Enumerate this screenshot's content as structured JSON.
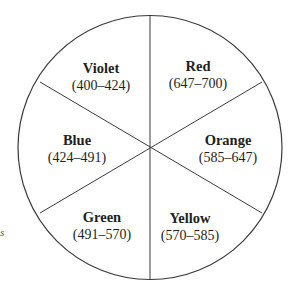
{
  "diagram": {
    "type": "color-wheel",
    "segments": [
      {
        "name": "Violet",
        "range": "(400–424)"
      },
      {
        "name": "Red",
        "range": "(647–700)"
      },
      {
        "name": "Orange",
        "range": "(585–647)"
      },
      {
        "name": "Yellow",
        "range": "(570–585)"
      },
      {
        "name": "Green",
        "range": "(491–570)"
      },
      {
        "name": "Blue",
        "range": "(424–491)"
      }
    ],
    "stray_text": "s",
    "colors": {
      "line": "#3a3a3a",
      "text": "#231f20",
      "background": "#ffffff"
    }
  }
}
